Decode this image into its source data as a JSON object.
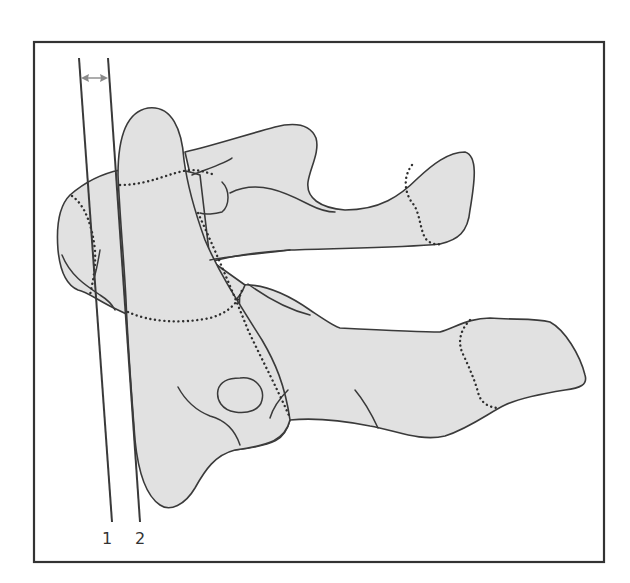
{
  "figure": {
    "frame_color": "#333333",
    "bone_fill": "#e1e1e1",
    "outline_color": "#3a3a3a",
    "reference_lines": [
      {
        "id": 1,
        "label": "1"
      },
      {
        "id": 2,
        "label": "2"
      }
    ],
    "measurement": {
      "icon": "double-arrow-icon",
      "between": [
        "1",
        "2"
      ]
    }
  }
}
